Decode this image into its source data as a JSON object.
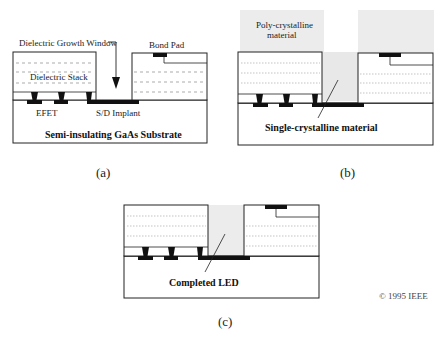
{
  "figure": {
    "panels": [
      {
        "id": "a",
        "caption": "(a)",
        "labels": {
          "growth_window": "Dielectric Growth Window",
          "bond_pad": "Bond Pad",
          "dielectric_stack": "Dielectric Stack",
          "efet": "EFET",
          "sd_implant": "S/D Implant",
          "substrate": "Semi-insulating GaAs Substrate"
        }
      },
      {
        "id": "b",
        "caption": "(b)",
        "labels": {
          "poly_line1": "Poly-crystalline",
          "poly_line2": "material",
          "single": "Single-crystalline material"
        }
      },
      {
        "id": "c",
        "caption": "(c)",
        "labels": {
          "completed": "Completed LED"
        }
      }
    ],
    "copyright": "© 1995 IEEE",
    "colors": {
      "line": "#222222",
      "metal": "#111111",
      "dashed": "#888888",
      "poly_fill": "#ececec",
      "grown_fill": "#e8e8e8"
    }
  }
}
